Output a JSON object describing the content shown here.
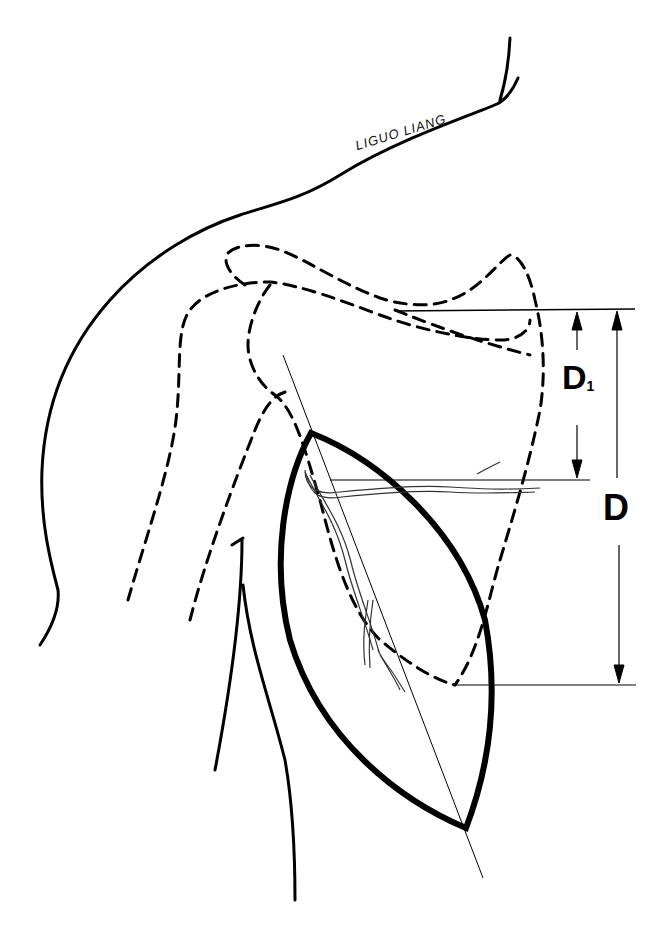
{
  "figure": {
    "signature": "LIGUO LIANG",
    "dimension_labels": {
      "d1_main": "D",
      "d1_sub": "1",
      "d": "D"
    },
    "colors": {
      "stroke": "#000000",
      "background": "#ffffff"
    }
  }
}
